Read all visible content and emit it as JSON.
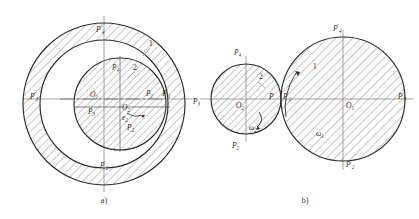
{
  "figure": {
    "stroke_color": "#2b2b2b",
    "hatch_color": "#555555",
    "axis_color": "#777777",
    "label_color": "#2a2a2a"
  },
  "panels": [
    {
      "id": "a",
      "caption": "a)",
      "description": "Internally tangent circles: large annulus with inner hatched circle",
      "circles": [
        {
          "name": "outer-prime-circle",
          "cx": 104,
          "cy": 104,
          "r": 81,
          "hatched": true
        },
        {
          "name": "middle-circle",
          "cx": 104,
          "cy": 104,
          "r": 64,
          "hatched": false
        },
        {
          "name": "inner-circle",
          "cx": 120,
          "cy": 104,
          "r": 46,
          "hatched": true
        }
      ],
      "centers": [
        {
          "name": "O1",
          "base": "O",
          "sub": "1",
          "prime": false,
          "x": 96,
          "y": 99,
          "lx": 92,
          "ly": 96
        },
        {
          "name": "O2",
          "base": "O",
          "sub": "2",
          "prime": false,
          "x": 120,
          "y": 107,
          "lx": 124,
          "ly": 108
        }
      ],
      "points": [
        {
          "name": "P4-prime",
          "base": "P",
          "sub": "4",
          "prime": true,
          "lx": 96,
          "ly": 32
        },
        {
          "name": "P4",
          "base": "P",
          "sub": "4",
          "prime": false,
          "lx": 112,
          "ly": 70
        },
        {
          "name": "P3-prime",
          "base": "P",
          "sub": "3",
          "prime": true,
          "lx": 30,
          "ly": 99
        },
        {
          "name": "P3",
          "base": "P",
          "sub": "3",
          "prime": false,
          "lx": 91,
          "ly": 112
        },
        {
          "name": "P1",
          "base": "P",
          "sub": "1",
          "prime": false,
          "lx": 148,
          "ly": 96
        },
        {
          "name": "P1-prime",
          "base": "P",
          "sub": "1",
          "prime": true,
          "lx": 164,
          "ly": 96
        },
        {
          "name": "P2",
          "base": "P",
          "sub": "2",
          "prime": false,
          "lx": 127,
          "ly": 128
        },
        {
          "name": "P2-prime",
          "base": "P",
          "sub": "2",
          "prime": true,
          "lx": 101,
          "ly": 167
        }
      ],
      "annotations": [
        {
          "name": "numeral-1",
          "text": "1",
          "x": 146,
          "y": 52,
          "italic": false
        },
        {
          "name": "numeral-2",
          "text": "2",
          "x": 131,
          "y": 75,
          "italic": false
        },
        {
          "name": "e2-label",
          "base": "e",
          "sub": "2",
          "prime": false,
          "lx": 124,
          "ly": 118
        }
      ]
    },
    {
      "id": "b",
      "caption": "b)",
      "description": "Externally tangent circles: small hatched circle tangent to large hatched circle",
      "circles": [
        {
          "name": "small-circle",
          "cx": 246,
          "cy": 99,
          "r": 35,
          "hatched": true
        },
        {
          "name": "large-circle",
          "cx": 343,
          "cy": 99,
          "r": 62,
          "hatched": true
        }
      ],
      "centers": [
        {
          "name": "O2",
          "base": "O",
          "sub": "2",
          "prime": false,
          "x": 246,
          "y": 99,
          "lx": 248,
          "ly": 106
        },
        {
          "name": "O1",
          "base": "O",
          "sub": "1",
          "prime": false,
          "x": 343,
          "y": 99,
          "lx": 345,
          "ly": 106
        }
      ],
      "points": [
        {
          "name": "P4",
          "base": "P",
          "sub": "4",
          "prime": false,
          "lx": 236,
          "ly": 53
        },
        {
          "name": "P4-prime",
          "base": "P",
          "sub": "4",
          "prime": true,
          "lx": 334,
          "ly": 31
        },
        {
          "name": "P3",
          "base": "P",
          "sub": "3",
          "prime": false,
          "lx": 193,
          "ly": 102
        },
        {
          "name": "P3-prime",
          "base": "P",
          "sub": "3",
          "prime": true,
          "lx": 400,
          "ly": 98
        },
        {
          "name": "P-tangent",
          "base": "P",
          "sub": "",
          "prime": false,
          "lx": 270,
          "ly": 97
        },
        {
          "name": "P1-prime",
          "base": "P",
          "sub": "1",
          "prime": true,
          "lx": 285,
          "ly": 97
        },
        {
          "name": "P2",
          "base": "P",
          "sub": "2",
          "prime": false,
          "lx": 234,
          "ly": 146
        },
        {
          "name": "P2-prime",
          "base": "P",
          "sub": "2",
          "prime": true,
          "lx": 344,
          "ly": 166
        }
      ],
      "annotations": [
        {
          "name": "numeral-1",
          "text": "1",
          "x": 314,
          "y": 68,
          "italic": false
        },
        {
          "name": "numeral-2",
          "text": "2",
          "x": 260,
          "y": 78,
          "italic": false
        },
        {
          "name": "omega2-label",
          "base": "ω",
          "sub": "2",
          "prime": false,
          "lx": 250,
          "ly": 128
        },
        {
          "name": "omega1-label",
          "base": "ω",
          "sub": "1",
          "prime": false,
          "lx": 318,
          "ly": 134
        }
      ]
    }
  ]
}
